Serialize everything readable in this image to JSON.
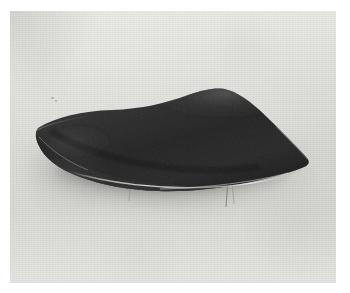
{
  "image": {
    "kind": "photograph",
    "medium": "black-and-white photographic print",
    "orientation": "landscape",
    "subject": "dark lens-shaped modernist dish",
    "alt_text": "Black-and-white photograph of a dark, low, leaf- or lens-shaped dish with upswept pointed ends, resting on thin wire legs against a plain light grey seamless backdrop with a soft shadow beneath.",
    "caption": "",
    "border": {
      "style": "white print margin",
      "color": "#ffffff",
      "left_px": 10,
      "top_px": 11,
      "right_px": 14,
      "bottom_px": 10
    }
  },
  "palette": {
    "paper_white": "#ffffff",
    "backdrop_light": "#e7e7e4",
    "backdrop_mid": "#d7d7d3",
    "backdrop_dark": "#c7c7c3",
    "object_dark": "#161616",
    "object_mid": "#2b2b2b",
    "object_highlight": "#cfcfc9",
    "rim_highlight": "#e3e3dd",
    "shadow": "#3a3a3a"
  },
  "object": {
    "name": "lens-shaped dish",
    "body_label": "dish body",
    "left_tip_label": "left upswept point",
    "right_tip_label": "right upswept point",
    "crest_label": "upper ridge crest",
    "rim_label": "bright rim highlight",
    "leg_label": "wire leg",
    "leg_count": 2,
    "surface_sheen_label": "surface sheen"
  },
  "scene": {
    "backdrop_label": "seamless studio backdrop",
    "cast_shadow_label": "cast shadow",
    "contact_shadow_label": "contact shadow",
    "grain_label": "film grain",
    "speck_label": "scan speck"
  }
}
